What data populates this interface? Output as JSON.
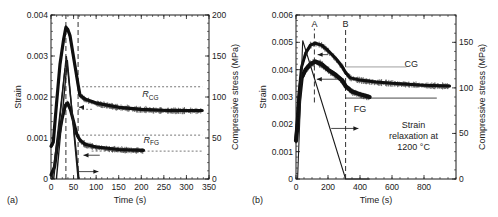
{
  "figure": {
    "width": 498,
    "height": 217,
    "colors": {
      "ink": "#1a1a1a",
      "gray_line": "#888888",
      "noise": "#111111"
    }
  },
  "chart_data": [
    {
      "id": "a",
      "type": "line",
      "panel_label": "(a)",
      "title": "",
      "xlabel": "Time (s)",
      "ylabel": "Strain",
      "y2label": "Compressive stress (MPa)",
      "xlim": [
        0,
        350
      ],
      "ylim": [
        0,
        0.004
      ],
      "y2lim": [
        0,
        200
      ],
      "xticks": [
        0,
        50,
        100,
        150,
        200,
        250,
        300,
        350
      ],
      "yticks": [
        0,
        0.001,
        0.002,
        0.003,
        0.004
      ],
      "ytick_labels": [
        "0",
        "0.001",
        "0.002",
        "0.003",
        "0.004"
      ],
      "y2ticks": [
        0,
        50,
        100,
        150,
        200
      ],
      "plot_box": {
        "x0": 51,
        "x1": 209,
        "y0": 179,
        "y1": 15
      },
      "series": [
        {
          "name": "Strain CG",
          "style": "noisy",
          "width": 3.2,
          "points": [
            [
              0,
              0.0008
            ],
            [
              5,
              0.0009
            ],
            [
              12,
              0.0018
            ],
            [
              20,
              0.0028
            ],
            [
              28,
              0.0034
            ],
            [
              33,
              0.0037
            ],
            [
              37,
              0.00365
            ],
            [
              42,
              0.0035
            ],
            [
              48,
              0.0031
            ],
            [
              54,
              0.0027
            ],
            [
              60,
              0.0023
            ],
            [
              64,
              0.00205
            ],
            [
              75,
              0.00195
            ],
            [
              100,
              0.00185
            ],
            [
              150,
              0.00175
            ],
            [
              200,
              0.0017
            ],
            [
              260,
              0.00167
            ],
            [
              335,
              0.00167
            ]
          ]
        },
        {
          "name": "Strain FG",
          "style": "noisy",
          "width": 3.2,
          "points": [
            [
              0,
              0.0001
            ],
            [
              8,
              0.0003
            ],
            [
              15,
              0.0009
            ],
            [
              25,
              0.0015
            ],
            [
              32,
              0.0018
            ],
            [
              37,
              0.00185
            ],
            [
              43,
              0.0017
            ],
            [
              50,
              0.0014
            ],
            [
              57,
              0.0011
            ],
            [
              64,
              0.00095
            ],
            [
              75,
              0.00085
            ],
            [
              100,
              0.00078
            ],
            [
              150,
              0.00072
            ],
            [
              205,
              0.0007
            ]
          ]
        },
        {
          "name": "Stress CG",
          "axis": "y2",
          "style": "solid",
          "width": 1.4,
          "points": [
            [
              6,
              0
            ],
            [
              34,
              150
            ],
            [
              62,
              0
            ]
          ]
        },
        {
          "name": "Stress FG",
          "axis": "y2",
          "style": "solid",
          "width": 1.4,
          "points": [
            [
              12,
              0
            ],
            [
              36,
              145
            ],
            [
              60,
              0
            ]
          ]
        },
        {
          "name": "Stress loading trace",
          "axis": "y2",
          "style": "solid",
          "width": 1.2,
          "points": [
            [
              3,
              0
            ],
            [
              31,
              135
            ]
          ]
        }
      ],
      "vlines": [
        {
          "x": 33,
          "style": "dashed"
        },
        {
          "x": 60,
          "style": "dashed"
        }
      ],
      "hlines": [
        {
          "y": 0.00225,
          "x0": 60,
          "x1": 335,
          "style": "dotted"
        },
        {
          "y": 0.00107,
          "x0": 60,
          "x1": 335,
          "style": "dotted"
        },
        {
          "y": 0.00068,
          "x0": 90,
          "x1": 335,
          "style": "dotted"
        },
        {
          "y": 0.0017,
          "x0": 60,
          "x1": 95,
          "style": "dotted"
        }
      ],
      "arrows": [
        {
          "x0": 72,
          "x1": 62,
          "y": 0.00175,
          "dir": "left"
        },
        {
          "x0": 108,
          "x1": 72,
          "y": 0.00058,
          "dir": "left"
        },
        {
          "x0": 62,
          "x1": 105,
          "y": 0.00018,
          "dir": "right"
        }
      ],
      "annotations": [
        {
          "text_main": "R",
          "text_sub": "CG",
          "x": 220,
          "y": 0.002
        },
        {
          "text_main": "R",
          "text_sub": "FG",
          "x": 222,
          "y": 0.00088
        }
      ]
    },
    {
      "id": "b",
      "type": "line",
      "panel_label": "(b)",
      "title": "",
      "xlabel": "Time (s)",
      "ylabel": "Strain",
      "y2label": "Compressive stress (MPa)",
      "xlim": [
        0,
        1000
      ],
      "ylim": [
        0,
        0.006
      ],
      "y2lim": [
        0,
        180
      ],
      "xticks": [
        0,
        200,
        400,
        600,
        800
      ],
      "yticks": [
        0,
        0.001,
        0.002,
        0.003,
        0.004,
        0.005,
        0.006
      ],
      "ytick_labels": [
        "0",
        "0.001",
        "0.002",
        "0.003",
        "0.004",
        "0.005",
        "0.006"
      ],
      "y2ticks": [
        0,
        50,
        100,
        150
      ],
      "plot_box": {
        "x0": 296,
        "x1": 456,
        "y0": 179,
        "y1": 15
      },
      "series": [
        {
          "name": "Strain CG",
          "style": "noisy",
          "width": 3.0,
          "points": [
            [
              0,
              0.0015
            ],
            [
              10,
              0.0022
            ],
            [
              20,
              0.0032
            ],
            [
              35,
              0.0041
            ],
            [
              60,
              0.0046
            ],
            [
              90,
              0.0049
            ],
            [
              120,
              0.00497
            ],
            [
              160,
              0.0049
            ],
            [
              200,
              0.0047
            ],
            [
              250,
              0.0044
            ],
            [
              290,
              0.0041
            ],
            [
              310,
              0.0039
            ],
            [
              340,
              0.0037
            ],
            [
              400,
              0.00362
            ],
            [
              500,
              0.00355
            ],
            [
              600,
              0.0035
            ],
            [
              700,
              0.00347
            ],
            [
              800,
              0.00343
            ],
            [
              960,
              0.0034
            ]
          ]
        },
        {
          "name": "Strain FG",
          "style": "noisy",
          "width": 4.2,
          "points": [
            [
              0,
              0.0014
            ],
            [
              10,
              0.002
            ],
            [
              20,
              0.0029
            ],
            [
              35,
              0.0037
            ],
            [
              60,
              0.004
            ],
            [
              90,
              0.0042
            ],
            [
              120,
              0.0043
            ],
            [
              160,
              0.0042
            ],
            [
              200,
              0.004
            ],
            [
              250,
              0.0038
            ],
            [
              290,
              0.0036
            ],
            [
              310,
              0.0034
            ],
            [
              350,
              0.0032
            ],
            [
              400,
              0.0031
            ],
            [
              460,
              0.003
            ]
          ]
        },
        {
          "name": "Stress",
          "axis": "y2",
          "style": "solid",
          "width": 1.1,
          "points": [
            [
              10,
              0
            ],
            [
              42,
              152
            ],
            [
              310,
              0
            ],
            [
              460,
              0
            ]
          ]
        }
      ],
      "vlines": [
        {
          "x": 115,
          "style": "dashed",
          "label": "A",
          "y0": 0.0028,
          "y1": 0.0055
        },
        {
          "x": 310,
          "style": "dashed",
          "label": "B",
          "y0": 0,
          "y1": 0.0055
        }
      ],
      "hlines": [
        {
          "y": 0.0041,
          "x0": 310,
          "x1": 690,
          "style": "solid-gray"
        },
        {
          "y": 0.00296,
          "x0": 310,
          "x1": 880,
          "style": "solid"
        }
      ],
      "arrows": [
        {
          "x0": 200,
          "x1": 135,
          "y": 0.00455,
          "dir": "left"
        },
        {
          "x0": 300,
          "x1": 130,
          "y": 0.00365,
          "dir": "left"
        },
        {
          "x0": 220,
          "x1": 390,
          "y": 0.00185,
          "dir": "right"
        }
      ],
      "annotations": [
        {
          "text_main": "CG",
          "x": 720,
          "y": 0.0041
        },
        {
          "text_main": "FG",
          "x": 400,
          "y": 0.00245
        },
        {
          "text_main": "Strain",
          "x": 735,
          "y": 0.00185
        },
        {
          "text_main": "relaxation at",
          "x": 735,
          "y": 0.00145
        },
        {
          "text_main": "1200 °C",
          "x": 735,
          "y": 0.00105
        }
      ]
    }
  ]
}
